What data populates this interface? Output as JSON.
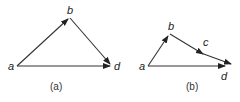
{
  "diagrams": [
    {
      "caption": "(a)",
      "points": {
        "a": {
          "label": "a"
        },
        "b": {
          "label": "b"
        },
        "d": {
          "label": "d"
        }
      },
      "vectors": [
        {
          "from": "a",
          "to": "b"
        },
        {
          "from": "b",
          "to": "d"
        },
        {
          "from": "a",
          "to": "d"
        }
      ]
    },
    {
      "caption": "(b)",
      "points": {
        "a": {
          "label": "a"
        },
        "b": {
          "label": "b"
        },
        "c": {
          "label": "c"
        },
        "d": {
          "label": "d"
        }
      },
      "vectors": [
        {
          "from": "a",
          "to": "b"
        },
        {
          "from": "b",
          "to": "c"
        },
        {
          "from": "c",
          "to": "d"
        },
        {
          "from": "a",
          "to": "d"
        }
      ]
    }
  ]
}
